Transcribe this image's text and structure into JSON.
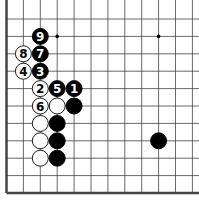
{
  "diagram": {
    "type": "go-board-fragment",
    "grid": {
      "x0": 6.5,
      "dx": 16.9,
      "y0": 19,
      "dy": 17.4,
      "cols": 12,
      "rows": 11
    },
    "star_points": [
      [
        3,
        1
      ],
      [
        9,
        1
      ]
    ],
    "stones": [
      {
        "col": 2,
        "row": 1,
        "color": "black",
        "label": "9"
      },
      {
        "col": 2,
        "row": 2,
        "color": "black",
        "label": "7"
      },
      {
        "col": 1,
        "row": 2,
        "color": "white",
        "label": "8"
      },
      {
        "col": 2,
        "row": 3,
        "color": "black",
        "label": "3"
      },
      {
        "col": 1,
        "row": 3,
        "color": "white",
        "label": "4"
      },
      {
        "col": 2,
        "row": 4,
        "color": "white",
        "label": "2"
      },
      {
        "col": 3,
        "row": 4,
        "color": "black",
        "label": "5"
      },
      {
        "col": 4,
        "row": 4,
        "color": "black",
        "label": "1"
      },
      {
        "col": 2,
        "row": 5,
        "color": "white",
        "label": "6"
      },
      {
        "col": 3,
        "row": 5,
        "color": "white",
        "label": ""
      },
      {
        "col": 4,
        "row": 5,
        "color": "black",
        "label": ""
      },
      {
        "col": 2,
        "row": 6,
        "color": "white",
        "label": ""
      },
      {
        "col": 3,
        "row": 6,
        "color": "black",
        "label": ""
      },
      {
        "col": 2,
        "row": 7,
        "color": "white",
        "label": ""
      },
      {
        "col": 3,
        "row": 7,
        "color": "black",
        "label": ""
      },
      {
        "col": 2,
        "row": 8,
        "color": "white",
        "label": ""
      },
      {
        "col": 3,
        "row": 8,
        "color": "black",
        "label": ""
      },
      {
        "col": 9,
        "row": 7,
        "color": "black",
        "label": ""
      }
    ]
  }
}
